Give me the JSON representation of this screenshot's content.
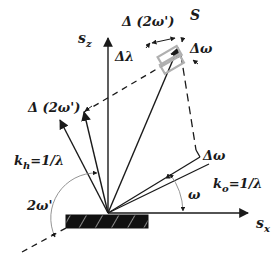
{
  "diagram": {
    "labels": {
      "delta_2omega_prime_top": "Δ (2ω')",
      "S": "S",
      "s_z": "s",
      "s_z_sub": "z",
      "delta_lambda": "Δλ",
      "delta_omega_top": "Δω",
      "delta_2omega_prime_left": "Δ (2ω')",
      "k_h": "k",
      "k_h_sub": "h",
      "k_h_eq": "=1/λ",
      "two_omega_prime": "2ω'",
      "delta_omega_right": "Δω",
      "k_o": "k",
      "k_o_sub": "o",
      "k_o_eq": "=1/λ",
      "omega": "ω",
      "s_x": "s",
      "s_x_sub": "x"
    },
    "colors": {
      "line": "#1a1a1a",
      "gray_box": "#b0b0b0",
      "arc": "#888888"
    }
  }
}
